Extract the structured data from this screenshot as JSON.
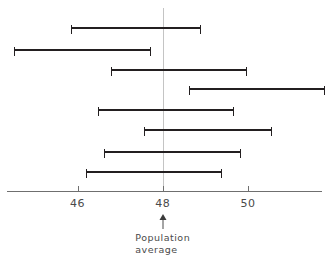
{
  "chart_data": {
    "type": "bar",
    "subtype": "horizontal-interval-range-plot",
    "title": "",
    "xlabel": "",
    "ylabel": "",
    "xlim": [
      43.6,
      51.9
    ],
    "grid": false,
    "legend": null,
    "axis": {
      "tick_labels": [
        "46",
        "48",
        "50"
      ],
      "tick_values": [
        46,
        50,
        50
      ],
      "ticks": [
        46,
        48,
        50
      ]
    },
    "reference_line": {
      "value": 48,
      "label_line1": "Population",
      "label_line2": "average",
      "arrow": "up-arrow",
      "color": "#c4c4c4"
    },
    "bar_color": "#231f20",
    "categories": [
      "1",
      "2",
      "3",
      "4",
      "5",
      "6",
      "7",
      "8"
    ],
    "intervals": [
      {
        "name": "interval-1",
        "low": 45.85,
        "high": 48.9
      },
      {
        "name": "interval-2",
        "low": 44.51,
        "high": 47.73
      },
      {
        "name": "interval-3",
        "low": 46.79,
        "high": 49.98
      },
      {
        "name": "interval-4",
        "low": 48.62,
        "high": 51.81
      },
      {
        "name": "interval-5",
        "low": 46.48,
        "high": 49.67
      },
      {
        "name": "interval-6",
        "low": 47.56,
        "high": 50.57
      },
      {
        "name": "interval-7",
        "low": 46.62,
        "high": 49.84
      },
      {
        "name": "interval-8",
        "low": 46.2,
        "high": 49.39
      }
    ]
  },
  "annotation": {
    "arrow_glyph": "▲",
    "line1": "Population",
    "line2": "average"
  }
}
